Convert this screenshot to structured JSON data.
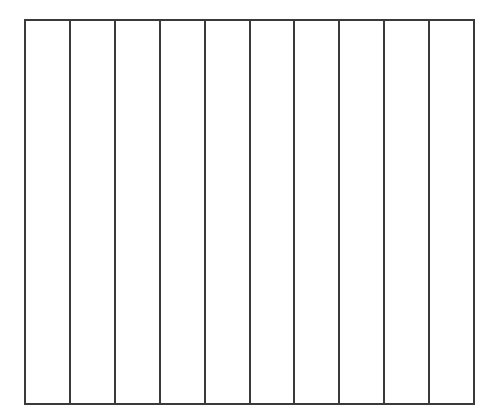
{
  "diagram": {
    "type": "column-grid",
    "columns": 10,
    "rows": 1,
    "cells": [
      {
        "index": 1,
        "label": ""
      },
      {
        "index": 2,
        "label": ""
      },
      {
        "index": 3,
        "label": ""
      },
      {
        "index": 4,
        "label": ""
      },
      {
        "index": 5,
        "label": ""
      },
      {
        "index": 6,
        "label": ""
      },
      {
        "index": 7,
        "label": ""
      },
      {
        "index": 8,
        "label": ""
      },
      {
        "index": 9,
        "label": ""
      },
      {
        "index": 10,
        "label": ""
      }
    ],
    "colors": {
      "line": "#3a3a3a",
      "background": "#ffffff"
    }
  }
}
